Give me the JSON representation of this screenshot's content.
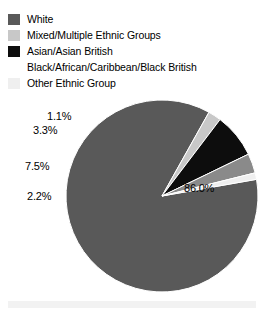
{
  "legend": {
    "items": [
      {
        "label": "White",
        "color": "#595959",
        "swatch_name": "legend-swatch-white"
      },
      {
        "label": "Mixed/Multiple Ethnic Groups",
        "color": "#c8c8c8",
        "swatch_name": "legend-swatch-mixed"
      },
      {
        "label": "Asian/Asian British",
        "color": "#0d0d0d",
        "swatch_name": "legend-swatch-asian"
      },
      {
        "label": "Black/African/Caribbean/Black British",
        "color": "#8a8a8a",
        "swatch_name": "legend-swatch-black"
      },
      {
        "label": "Other Ethnic Group",
        "color": "#efefef",
        "swatch_name": "legend-swatch-other"
      }
    ]
  },
  "labels": {
    "white": "86.0%",
    "mixed": "2.2%",
    "asian": "7.5%",
    "black_african": "3.3%",
    "other": "1.1%"
  },
  "chart_data": {
    "type": "pie",
    "title": "",
    "categories": [
      "White",
      "Mixed/Multiple Ethnic Groups",
      "Asian/Asian British",
      "Black/African/Caribbean/Black British",
      "Other Ethnic Group"
    ],
    "values": [
      86.0,
      2.2,
      7.5,
      3.3,
      1.1
    ],
    "value_labels": [
      "86.0%",
      "2.2%",
      "7.5%",
      "3.3%",
      "1.1%"
    ],
    "colors": [
      "#595959",
      "#c8c8c8",
      "#0d0d0d",
      "#8a8a8a",
      "#efefef"
    ],
    "units": "percent",
    "total": 100.1,
    "legend_position": "top",
    "grid": false,
    "start_angle_deg": -10,
    "direction": "clockwise",
    "label_placement": {
      "White": "inside",
      "Mixed/Multiple Ethnic Groups": "outside-left",
      "Asian/Asian British": "outside-left",
      "Black/African/Caribbean/Black British": "outside-left",
      "Other Ethnic Group": "outside-left"
    }
  },
  "geometry": {
    "center_x": 162,
    "center_y": 196,
    "radius": 96
  }
}
